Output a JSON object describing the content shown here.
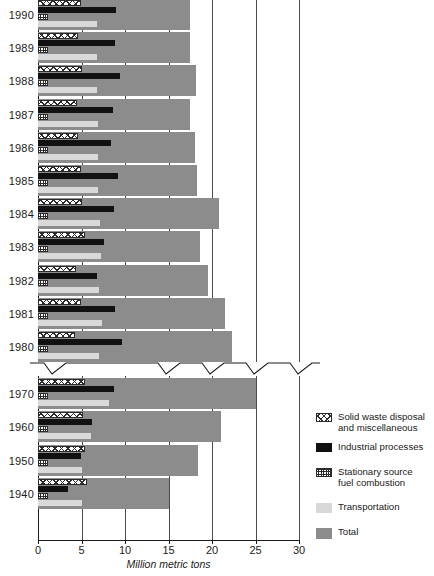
{
  "chart": {
    "type": "bar",
    "title": "",
    "xlabel": "Million metric tons",
    "ylabel": "",
    "xlim": [
      0,
      30
    ],
    "xticks": [
      0,
      5,
      10,
      15,
      20,
      25,
      30
    ],
    "grid": true,
    "axis_break": true,
    "axis_break_note": "y-axis break between 1980 and 1970",
    "orientation": "horizontal",
    "legend_position": "right",
    "series_names": [
      "Solid waste disposal and miscellaneous",
      "Industrial processes",
      "Stationary source fuel combustion",
      "Transportation",
      "Total"
    ],
    "categories": [
      "1990",
      "1989",
      "1988",
      "1987",
      "1986",
      "1985",
      "1984",
      "1983",
      "1982",
      "1981",
      "1980",
      "1970",
      "1960",
      "1950",
      "1940"
    ],
    "series": [
      {
        "name": "Solid waste disposal and miscellaneous",
        "values": [
          4.9,
          4.6,
          5.0,
          4.5,
          4.6,
          4.9,
          5.0,
          5.4,
          4.4,
          4.9,
          4.3,
          5.4,
          5.2,
          5.4,
          5.6
        ]
      },
      {
        "name": "Industrial processes",
        "values": [
          9.0,
          8.9,
          9.4,
          8.6,
          8.4,
          9.2,
          8.7,
          7.6,
          6.8,
          8.9,
          9.6,
          8.7,
          6.2,
          4.9,
          3.4
        ]
      },
      {
        "name": "Stationary source fuel combustion",
        "values": [
          1.1,
          1.1,
          1.1,
          1.1,
          1.1,
          1.1,
          1.1,
          1.1,
          1.1,
          1.1,
          1.1,
          1.1,
          1.1,
          1.1,
          1.1
        ]
      },
      {
        "name": "Transportation",
        "values": [
          6.8,
          6.8,
          6.8,
          6.9,
          6.9,
          6.9,
          7.1,
          7.2,
          7.0,
          7.3,
          7.0,
          8.2,
          6.1,
          5.1,
          5.0
        ]
      },
      {
        "name": "Total",
        "values": [
          17.5,
          17.5,
          18.2,
          17.5,
          18.0,
          18.3,
          20.8,
          18.6,
          19.5,
          21.5,
          22.3,
          25.0,
          21.0,
          18.4,
          15.0
        ]
      }
    ],
    "legend": [
      {
        "label": "Solid waste disposal\nand miscellaneous",
        "swatch": "diagonal-hatch-icon",
        "color": "#ffffff"
      },
      {
        "label": "Industrial processes",
        "swatch": "solid-black-icon",
        "color": "#111111"
      },
      {
        "label": "Stationary source\nfuel combustion",
        "swatch": "checker-hatch-icon",
        "color": "#ffffff"
      },
      {
        "label": "Transportation",
        "swatch": "light-gray-icon",
        "color": "#d9d9d9"
      },
      {
        "label": "Total",
        "swatch": "dark-gray-icon",
        "color": "#8c8c8c"
      }
    ],
    "colors": {
      "total": "#8c8c8c",
      "transportation": "#d9d9d9",
      "industrial": "#111111",
      "hatch_line": "#2b2b2b",
      "axis": "#1a1a1a",
      "grid": "#4a4a4a",
      "background": "#ffffff"
    }
  }
}
